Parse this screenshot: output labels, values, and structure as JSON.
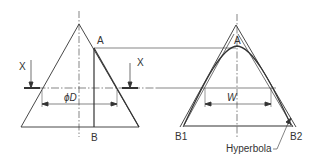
{
  "diagram": {
    "left_view": {
      "labels": {
        "point_a": "A",
        "point_b": "B",
        "section_left": "X",
        "section_right": "X",
        "diameter": "ϕD"
      }
    },
    "right_view": {
      "labels": {
        "point_a": "A",
        "point_b1": "B1",
        "point_b2": "B2",
        "width": "W",
        "curve": "Hyperbola"
      }
    },
    "colors": {
      "line": "#333333",
      "background": "#ffffff"
    }
  }
}
